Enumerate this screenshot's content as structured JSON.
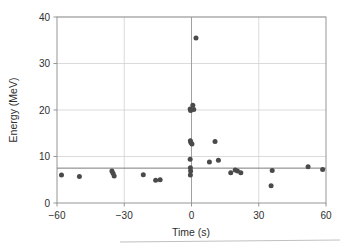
{
  "chart_data": {
    "type": "scatter",
    "title": "",
    "xlabel": "Time (s)",
    "ylabel": "Energy (MeV)",
    "xlim": [
      -60,
      60
    ],
    "ylim": [
      0,
      40
    ],
    "xticks": [
      -60,
      -30,
      0,
      30,
      60
    ],
    "xtick_labels": [
      "−60",
      "−30",
      "0",
      "30",
      "60"
    ],
    "yticks": [
      0,
      10,
      20,
      30,
      40
    ],
    "ytick_labels": [
      "0",
      "10",
      "20",
      "30",
      "40"
    ],
    "grid": true,
    "legend": "none",
    "marker_color": "#4a4a4a",
    "grid_color": "#d2d2d2",
    "frame_color": "#8a8a8a",
    "annotations": [
      {
        "name": "vertical-reference-line",
        "type": "vline",
        "x": 0
      },
      {
        "name": "horizontal-trend-line",
        "type": "hline",
        "y": 7.5
      }
    ],
    "points": [
      {
        "x": -58.0,
        "y": 6.0
      },
      {
        "x": -50.0,
        "y": 5.7
      },
      {
        "x": -35.5,
        "y": 6.9
      },
      {
        "x": -35.0,
        "y": 6.4
      },
      {
        "x": -34.5,
        "y": 5.8
      },
      {
        "x": -21.5,
        "y": 6.1
      },
      {
        "x": -16.0,
        "y": 4.9
      },
      {
        "x": -14.0,
        "y": 5.0
      },
      {
        "x": -0.6,
        "y": 20.2
      },
      {
        "x": -0.4,
        "y": 19.9
      },
      {
        "x": 0.6,
        "y": 21.0
      },
      {
        "x": 1.0,
        "y": 20.1
      },
      {
        "x": -0.5,
        "y": 13.4
      },
      {
        "x": -0.3,
        "y": 13.0
      },
      {
        "x": 0.2,
        "y": 12.7
      },
      {
        "x": -0.6,
        "y": 9.4
      },
      {
        "x": -0.5,
        "y": 7.6
      },
      {
        "x": -0.4,
        "y": 6.9
      },
      {
        "x": -0.5,
        "y": 6.0
      },
      {
        "x": 2.0,
        "y": 35.5
      },
      {
        "x": 8.0,
        "y": 8.8
      },
      {
        "x": 10.5,
        "y": 13.2
      },
      {
        "x": 12.0,
        "y": 9.2
      },
      {
        "x": 17.5,
        "y": 6.5
      },
      {
        "x": 19.5,
        "y": 7.1
      },
      {
        "x": 20.5,
        "y": 6.9
      },
      {
        "x": 22.0,
        "y": 6.5
      },
      {
        "x": 36.0,
        "y": 7.0
      },
      {
        "x": 35.5,
        "y": 3.7
      },
      {
        "x": 52.0,
        "y": 7.8
      },
      {
        "x": 58.5,
        "y": 7.2
      }
    ]
  }
}
